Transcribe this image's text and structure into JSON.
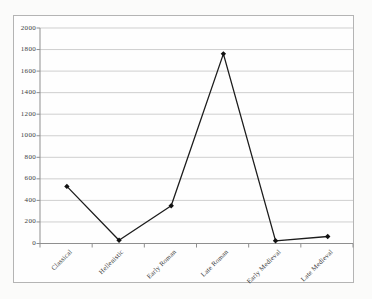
{
  "page": {
    "background": "#fbfbfa",
    "frame_border_color": "#b4b4b4",
    "frame_background": "#fefefe"
  },
  "chart_data": {
    "type": "line",
    "title": "",
    "xlabel": "",
    "ylabel": "",
    "categories": [
      "Classical",
      "Hellenistic",
      "Early Roman",
      "Late Roman",
      "Early Medieval",
      "Late Medieval"
    ],
    "values": [
      530,
      30,
      350,
      1760,
      25,
      65
    ],
    "ylim": [
      0,
      2000
    ],
    "yticks": [
      0,
      200,
      400,
      600,
      800,
      1000,
      1200,
      1400,
      1600,
      1800,
      2000
    ],
    "grid": "horizontal",
    "legend": "none",
    "marker": "diamond",
    "colors": {
      "line": "#1c1c1c",
      "marker": "#111111",
      "gridline": "#cfcfcf",
      "axis": "#8f8f8f",
      "tick": "#8f8f8f",
      "text": "#3c3c3c"
    }
  }
}
